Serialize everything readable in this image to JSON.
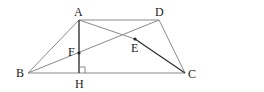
{
  "figure": {
    "type": "trapezoid-with-diagonals",
    "points": {
      "A": {
        "label": "A"
      },
      "B": {
        "label": "B"
      },
      "C": {
        "label": "C"
      },
      "D": {
        "label": "D"
      },
      "E": {
        "label": "E"
      },
      "F": {
        "label": "F"
      },
      "H": {
        "label": "H"
      }
    },
    "segments": [
      {
        "from": "A",
        "to": "D",
        "style": "thin"
      },
      {
        "from": "B",
        "to": "C",
        "style": "thin"
      },
      {
        "from": "A",
        "to": "B",
        "style": "thin"
      },
      {
        "from": "D",
        "to": "C",
        "style": "thin"
      },
      {
        "from": "A",
        "to": "E",
        "style": "thin"
      },
      {
        "from": "E",
        "to": "C",
        "style": "thick"
      },
      {
        "from": "B",
        "to": "D",
        "style": "thin"
      },
      {
        "from": "A",
        "to": "H",
        "style": "thick"
      }
    ],
    "right_angle_at": "H",
    "marked_points": [
      "E",
      "F"
    ]
  }
}
